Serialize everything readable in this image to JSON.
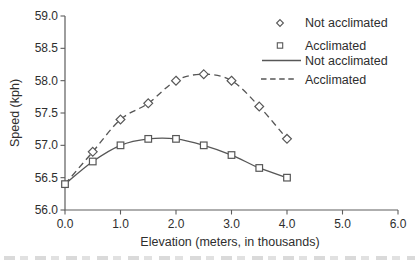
{
  "chart_data": {
    "type": "line",
    "title": "",
    "xlabel": "Elevation (meters, in thousands)",
    "ylabel": "Speed (kph)",
    "xlim": [
      0.0,
      6.0
    ],
    "ylim": [
      56.0,
      59.0
    ],
    "xticks": [
      "0.0",
      "1.0",
      "2.0",
      "3.0",
      "4.0",
      "5.0",
      "6.0"
    ],
    "yticks": [
      "56.0",
      "56.5",
      "57.0",
      "57.5",
      "58.0",
      "58.5",
      "59.0"
    ],
    "grid": "off",
    "legend_position": "top-right",
    "series": [
      {
        "name": "Not acclimated",
        "marker": "diamond",
        "line_style": "dashed",
        "marker_start_index": 1,
        "x": [
          0.0,
          0.5,
          1.0,
          1.5,
          2.0,
          2.5,
          3.0,
          3.5,
          4.0
        ],
        "y": [
          56.4,
          56.9,
          57.4,
          57.65,
          58.0,
          58.1,
          58.0,
          57.6,
          57.1
        ]
      },
      {
        "name": "Acclimated",
        "marker": "square",
        "line_style": "solid",
        "marker_start_index": 0,
        "x": [
          0.0,
          0.5,
          1.0,
          1.5,
          2.0,
          2.5,
          3.0,
          3.5,
          4.0
        ],
        "y": [
          56.4,
          56.75,
          57.0,
          57.1,
          57.1,
          57.0,
          56.85,
          56.65,
          56.5
        ]
      }
    ],
    "legend": [
      {
        "symbol": "diamond",
        "label": "Not acclimated"
      },
      {
        "symbol": "square",
        "label": "Acclimated"
      },
      {
        "symbol": "solid-line",
        "label": "Not acclimated"
      },
      {
        "symbol": "dashed-line",
        "label": "Acclimated"
      }
    ],
    "colors": {
      "line": "#575757",
      "axis": "#5e5e5e",
      "text": "#2e2e2e",
      "marker_fill": "#ffffff",
      "background": "#ffffff"
    }
  }
}
